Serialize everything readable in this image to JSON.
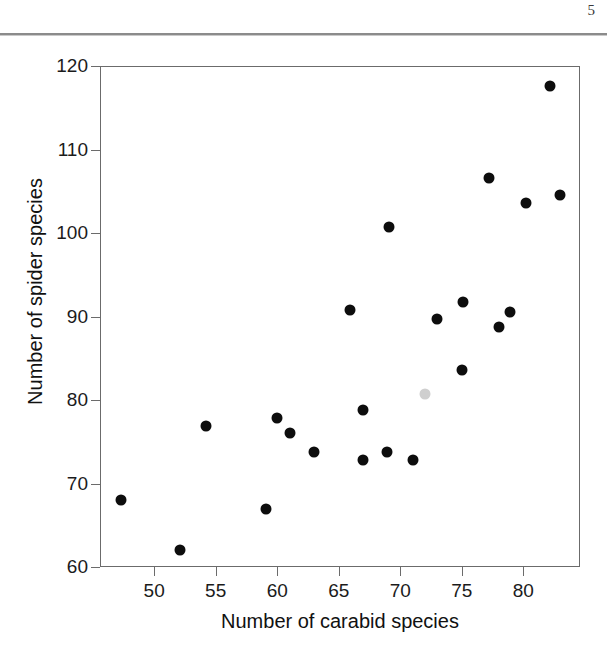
{
  "page": {
    "number": "5"
  },
  "chart_data": {
    "type": "scatter",
    "title": "",
    "xlabel": "Number of carabid species",
    "ylabel": "Number of spider species",
    "xlim": [
      45.6,
      84.6
    ],
    "ylim": [
      60,
      120
    ],
    "xticks": [
      50,
      55,
      60,
      65,
      70,
      75,
      80
    ],
    "xtick_labels": [
      "50",
      "55",
      "60",
      "65",
      "70",
      "75",
      "80"
    ],
    "yticks": [
      60,
      70,
      80,
      90,
      100,
      110,
      120
    ],
    "ytick_labels": [
      "60",
      "70",
      "80",
      "90",
      "100",
      "110",
      "120"
    ],
    "grid": false,
    "legend": null,
    "marker": "filled-circle",
    "point_color": "#0d0d0d",
    "highlight_color": "#cfcfcf",
    "points": [
      {
        "x": 47.3,
        "y": 68.0,
        "color": "#0d0d0d"
      },
      {
        "x": 52.1,
        "y": 62.0,
        "color": "#0d0d0d"
      },
      {
        "x": 54.2,
        "y": 76.9,
        "color": "#0d0d0d"
      },
      {
        "x": 59.1,
        "y": 67.0,
        "color": "#0d0d0d"
      },
      {
        "x": 60.0,
        "y": 77.9,
        "color": "#0d0d0d"
      },
      {
        "x": 61.0,
        "y": 76.0,
        "color": "#0d0d0d"
      },
      {
        "x": 63.0,
        "y": 73.8,
        "color": "#0d0d0d"
      },
      {
        "x": 65.9,
        "y": 90.8,
        "color": "#0d0d0d"
      },
      {
        "x": 67.0,
        "y": 78.8,
        "color": "#0d0d0d"
      },
      {
        "x": 67.0,
        "y": 72.8,
        "color": "#0d0d0d"
      },
      {
        "x": 68.9,
        "y": 73.8,
        "color": "#0d0d0d"
      },
      {
        "x": 69.1,
        "y": 100.7,
        "color": "#0d0d0d"
      },
      {
        "x": 71.0,
        "y": 72.8,
        "color": "#0d0d0d"
      },
      {
        "x": 72.0,
        "y": 80.7,
        "color": "#cfcfcf"
      },
      {
        "x": 73.0,
        "y": 89.7,
        "color": "#0d0d0d"
      },
      {
        "x": 75.1,
        "y": 91.7,
        "color": "#0d0d0d"
      },
      {
        "x": 75.0,
        "y": 83.6,
        "color": "#0d0d0d"
      },
      {
        "x": 77.2,
        "y": 106.6,
        "color": "#0d0d0d"
      },
      {
        "x": 78.0,
        "y": 88.7,
        "color": "#0d0d0d"
      },
      {
        "x": 78.9,
        "y": 90.5,
        "color": "#0d0d0d"
      },
      {
        "x": 80.2,
        "y": 103.6,
        "color": "#0d0d0d"
      },
      {
        "x": 82.2,
        "y": 117.6,
        "color": "#0d0d0d"
      },
      {
        "x": 83.0,
        "y": 104.6,
        "color": "#0d0d0d"
      }
    ]
  }
}
